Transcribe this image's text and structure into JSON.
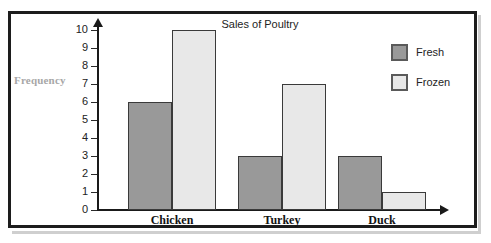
{
  "chart_data": {
    "type": "bar",
    "title": "Sales of Poultry",
    "xlabel": "",
    "ylabel": "Frequency",
    "categories": [
      "Chicken",
      "Turkey",
      "Duck"
    ],
    "series": [
      {
        "name": "Fresh",
        "color": "#999999",
        "values": [
          6,
          3,
          3
        ]
      },
      {
        "name": "Frozen",
        "color": "#e8e8e8",
        "values": [
          10,
          7,
          1
        ]
      }
    ],
    "ylim": [
      0,
      10
    ],
    "ytick_labels": [
      "10",
      "9",
      "8",
      "7",
      "6",
      "5",
      "4",
      "3",
      "2",
      "1",
      "0"
    ],
    "grid": false,
    "legend_position": "top-right",
    "axis_color": "#1a1a1a",
    "bar_border_color": "#3a3a3a",
    "ylabel_color": "#a7a7a7",
    "frame_color": "#1d1d1d",
    "background": "#ffffff"
  },
  "legend": {
    "entries": [
      {
        "label": "Fresh"
      },
      {
        "label": "Frozen"
      }
    ]
  },
  "axis": {
    "y_arrow": "arrow-up-icon",
    "x_arrow": "arrow-right-icon"
  }
}
